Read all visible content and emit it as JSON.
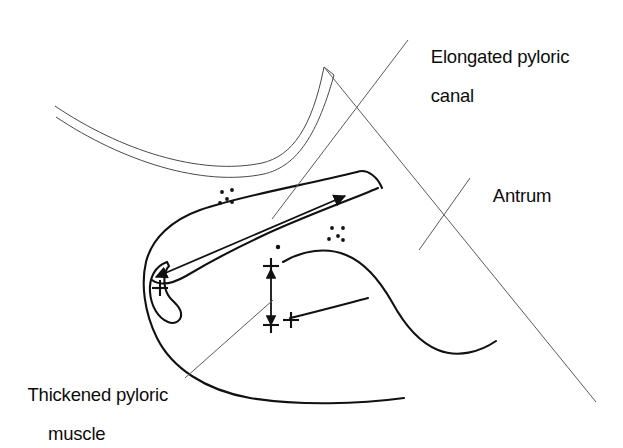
{
  "figure": {
    "background_color": "#ffffff",
    "ink_color": "#111111",
    "leader_line_color": "#5a5a5a"
  },
  "labels": {
    "elongated_pyloric_canal": {
      "line1": "Elongated pyloric",
      "line2": "canal"
    },
    "antrum": {
      "line1": "Antrum"
    },
    "thickened_pyloric_muscle": {
      "line1": "Thickened pyloric",
      "line2": "muscle"
    }
  },
  "markers": {
    "caliper_plus_pylorus": "+",
    "caliper_plus_muscle_top": "+",
    "caliper_plus_muscle_bottom": "+",
    "caliper_plus_muscle_side": "+",
    "dot_cluster_count": 5,
    "single_dot_count": 1
  },
  "annotations": {
    "canal_length_arrow": "double-headed horizontal arrow spanning elongated pyloric canal",
    "muscle_thickness_arrow": "double-headed vertical arrow spanning thickened pyloric muscle"
  }
}
